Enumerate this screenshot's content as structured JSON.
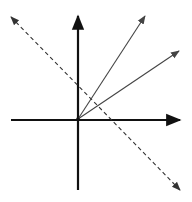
{
  "diagram": {
    "background": "#ffffff",
    "origin": [
      78,
      119
    ],
    "axes": {
      "color": "#111111",
      "x_axis": {
        "from": [
          11,
          120
        ],
        "to": [
          180,
          120
        ]
      },
      "y_axis": {
        "from": [
          78,
          190
        ],
        "to": [
          78,
          16
        ]
      }
    },
    "vectors": [
      {
        "name": "vector-steep",
        "from": [
          78,
          119
        ],
        "to": [
          145,
          16
        ],
        "color": "#444444"
      },
      {
        "name": "vector-shallow",
        "from": [
          78,
          119
        ],
        "to": [
          179,
          51
        ],
        "color": "#444444"
      }
    ],
    "dashed_line": {
      "from": [
        11,
        17
      ],
      "to": [
        180,
        190
      ],
      "color": "#333333"
    }
  }
}
